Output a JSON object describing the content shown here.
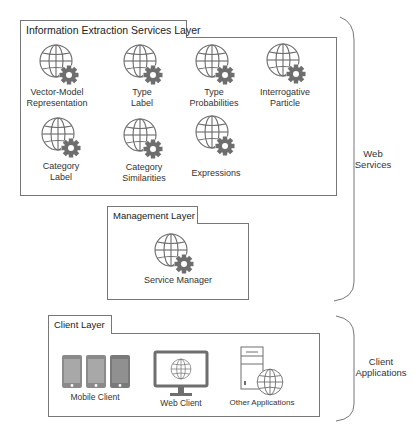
{
  "diagram": {
    "layers": {
      "info_extraction": {
        "title": "Information Extraction Services Layer",
        "services": [
          {
            "line1": "Vector-Model",
            "line2": "Representation",
            "icon": "globe-gear-icon"
          },
          {
            "line1": "Type",
            "line2": "Label",
            "icon": "globe-gear-icon"
          },
          {
            "line1": "Type",
            "line2": "Probabilities",
            "icon": "globe-gear-icon"
          },
          {
            "line1": "Interrogative",
            "line2": "Particle",
            "icon": "globe-gear-icon"
          },
          {
            "line1": "Category",
            "line2": "Label",
            "icon": "globe-gear-icon"
          },
          {
            "line1": "Category",
            "line2": "Similarities",
            "icon": "globe-gear-icon"
          },
          {
            "line1": "Expressions",
            "line2": "",
            "icon": "globe-gear-icon"
          }
        ]
      },
      "management": {
        "title": "Management Layer",
        "services": [
          {
            "line1": "Service Manager",
            "icon": "globe-gear-icon"
          }
        ]
      },
      "client": {
        "title": "Client Layer",
        "clients": [
          {
            "label": "Mobile Client",
            "icon": "mobile-devices-icon",
            "devices": [
              "Android",
              "Apple",
              "Windows"
            ]
          },
          {
            "label": "Web Client",
            "icon": "monitor-globe-icon"
          },
          {
            "label": "Other Applications",
            "icon": "server-globe-icon"
          }
        ]
      }
    },
    "groups": {
      "web_services": {
        "line1": "Web",
        "line2": "Services"
      },
      "client_applications": {
        "line1": "Client",
        "line2": "Applications"
      }
    },
    "colors": {
      "line": "#777777",
      "icon_stroke": "#6b6b6b",
      "gear": "#6e6e6e",
      "device_fill": "#8a8a8a"
    }
  }
}
